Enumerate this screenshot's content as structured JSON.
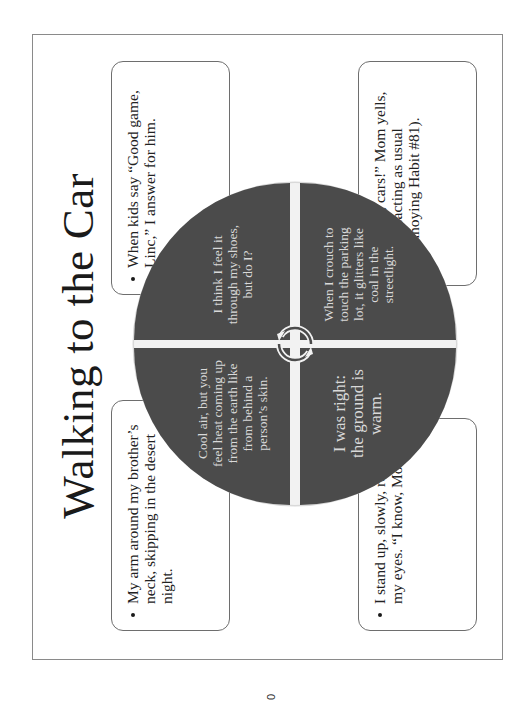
{
  "slide": {
    "title": "Walking to the Car",
    "callouts": [
      {
        "position": "top-left",
        "text": "My arm around my brother’s neck, skipping in the desert night."
      },
      {
        "position": "top-right",
        "text": "When kids say “Good game, Linc,” I answer for him."
      },
      {
        "position": "bottom-left",
        "text": "I stand up, slowly, rolling my eyes. “I know, Mom.”"
      },
      {
        "position": "bottom-right",
        "text": "“Alison, cars!” Mom yells, overreacting as usual (Annoying Habit #81)."
      }
    ],
    "cycle": {
      "segments": [
        {
          "position": "top-left",
          "text": "Cool air, but you feel heat coming up from the earth like from behind a person’s skin."
        },
        {
          "position": "top-right",
          "text": "I think I feel it through my shoes, but do I?"
        },
        {
          "position": "bottom-left",
          "text": "I was right: the ground is warm."
        },
        {
          "position": "bottom-right",
          "text": "When I crouch to touch the parking lot, it glitters like coal in the streetlight."
        }
      ],
      "center_icon": "cycle-arrows-icon",
      "segment_color": "#4b4b4b",
      "segment_text_color": "#d9d9d9"
    }
  },
  "page_number": "0",
  "orientation": "rotated -90°"
}
